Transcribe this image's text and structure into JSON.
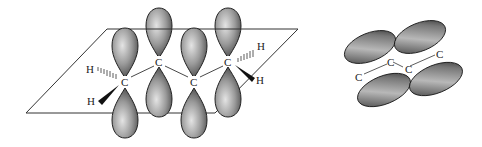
{
  "diagram": {
    "left": {
      "description": "butadiene p-orbitals perpendicular to molecular plane",
      "carbon_labels": [
        "C",
        "C",
        "C",
        "C"
      ],
      "hydrogen_labels": [
        "H",
        "H",
        "H",
        "H"
      ]
    },
    "right": {
      "description": "overlapping p-orbital lobes forming pi system",
      "carbon_labels": [
        "C",
        "C",
        "C",
        "C"
      ]
    },
    "colors": {
      "lobe_dark": "#3a3a3a",
      "lobe_light": "#d8d8d8",
      "line": "#333333"
    }
  }
}
